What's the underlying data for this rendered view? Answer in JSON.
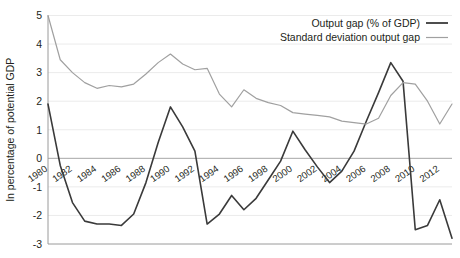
{
  "chart_data": {
    "type": "line",
    "title": "",
    "xlabel": "",
    "ylabel": "In percentage of potential GDP",
    "ylim": [
      -3,
      5
    ],
    "ytick_labels": [
      "5",
      "4",
      "3",
      "2",
      "1",
      "0",
      "-1",
      "-2",
      "-3"
    ],
    "yticks": [
      5,
      4,
      3,
      2,
      1,
      0,
      -1,
      -2,
      -3
    ],
    "grid": true,
    "legend_position": "top-right",
    "x": [
      1980,
      1981,
      1982,
      1983,
      1984,
      1985,
      1986,
      1987,
      1988,
      1989,
      1990,
      1991,
      1992,
      1993,
      1994,
      1995,
      1996,
      1997,
      1998,
      1999,
      2000,
      2001,
      2002,
      2003,
      2004,
      2005,
      2006,
      2007,
      2008,
      2009,
      2010,
      2011,
      2012,
      2013
    ],
    "xtick_values": [
      1980,
      1982,
      1984,
      1986,
      1988,
      1990,
      1992,
      1994,
      1996,
      1998,
      2000,
      2002,
      2004,
      2006,
      2008,
      2010,
      2012
    ],
    "xtick_labels": [
      "1980",
      "1982",
      "1984",
      "1986",
      "1988",
      "1990",
      "1992",
      "1994",
      "1996",
      "1998",
      "2000",
      "2002",
      "2004",
      "2006",
      "2008",
      "2010",
      "2012"
    ],
    "series": [
      {
        "name": "Output gap (% of GDP)",
        "color": "#3a3a3a",
        "width": 1.6,
        "values": [
          1.9,
          -0.25,
          -1.55,
          -2.2,
          -2.3,
          -2.3,
          -2.35,
          -1.95,
          -0.85,
          0.55,
          1.8,
          1.1,
          0.25,
          -2.3,
          -1.95,
          -1.3,
          -1.8,
          -1.4,
          -0.75,
          -0.1,
          0.95,
          0.3,
          -0.3,
          -0.85,
          -0.45,
          0.25,
          1.3,
          2.3,
          3.35,
          2.7,
          -2.5,
          -2.35,
          -1.45,
          -2.8
        ]
      },
      {
        "name": "Standard deviation output gap",
        "color": "#a0a0a0",
        "width": 1.2,
        "values": [
          5.0,
          3.45,
          3.0,
          2.65,
          2.45,
          2.55,
          2.5,
          2.6,
          2.95,
          3.35,
          3.65,
          3.3,
          3.1,
          3.15,
          2.25,
          1.8,
          2.4,
          2.1,
          1.95,
          1.85,
          1.6,
          1.55,
          1.5,
          1.45,
          1.3,
          1.25,
          1.2,
          1.4,
          2.2,
          2.65,
          2.6,
          2.0,
          1.2,
          1.9
        ]
      }
    ]
  },
  "legend": {
    "items": [
      {
        "label": "Output gap (% of GDP)",
        "color": "#3a3a3a",
        "width": 1.8
      },
      {
        "label": "Standard deviation output gap",
        "color": "#a0a0a0",
        "width": 1.2
      }
    ]
  }
}
